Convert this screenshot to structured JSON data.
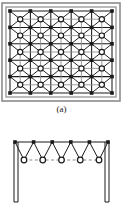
{
  "figure": {
    "type": "structural-engineering-diagram",
    "background_color": "#ffffff",
    "line_color": "#1a1a1a",
    "frame_color": "#8c8c8c",
    "dash_color": "#8c8c8c",
    "node_fill_color": "#1a1a1a",
    "node_open_fill": "#ffffff"
  },
  "panels": [
    {
      "id": "a",
      "caption": "(a)",
      "view": "plan",
      "frame": {
        "style": "double-line",
        "outer": {
          "x": 2,
          "y": 3,
          "width": 118,
          "height": 98
        },
        "inner": {
          "x": 6,
          "y": 7,
          "width": 110,
          "height": 90
        }
      },
      "grid": {
        "top_layer_cols": 6,
        "top_layer_rows": 6,
        "bottom_layer_cols": 5,
        "bottom_layer_rows": 5,
        "origin_x": 10,
        "origin_y": 11,
        "spacing_x": 20.4,
        "spacing_y": 16.4,
        "filled_node_shape": "square",
        "filled_node_size": 3.6,
        "open_node_shape": "circle",
        "open_node_radius": 2.6,
        "open_node_ring_width": 1.2
      }
    },
    {
      "id": "b",
      "caption": "(b)",
      "view": "elevation",
      "top_chord": {
        "node_count": 6,
        "node_shape": "square",
        "node_size": 3.6,
        "y": 14,
        "x_start": 15,
        "x_end": 108
      },
      "bottom_chord": {
        "node_count": 5,
        "node_shape": "circle",
        "node_radius": 2.8,
        "y": 32,
        "x_start": 24,
        "x_end": 99,
        "connector_style": "dashed"
      },
      "columns": [
        {
          "side": "left",
          "x": 16,
          "top": 14,
          "bottom": 74,
          "style": "double-line",
          "width": 4
        },
        {
          "side": "right",
          "x": 107,
          "top": 14,
          "bottom": 74,
          "style": "double-line",
          "width": 4
        }
      ],
      "web_members": "zigzag"
    }
  ],
  "chart_data": {
    "type": "diagram",
    "title": "",
    "panel_a": {
      "label": "(a)",
      "kind": "plan view of double-layer space grid",
      "top_layer_nodes": 36,
      "bottom_layer_nodes": 25,
      "top_layer_grid": "6 x 6",
      "bottom_layer_grid": "5 x 5",
      "diagonal_members_per_bottom_node": 4
    },
    "panel_b": {
      "label": "(b)",
      "kind": "elevation view of double-layer space grid on columns",
      "top_chord_nodes": 6,
      "bottom_chord_nodes": 5,
      "columns": 2,
      "bottom_chord_line_style": "dashed"
    }
  }
}
